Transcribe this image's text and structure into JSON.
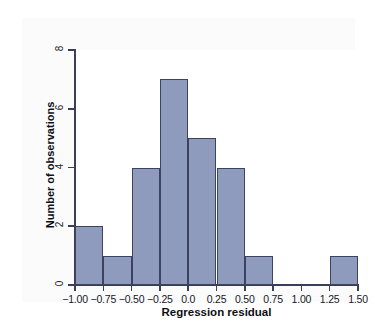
{
  "chart_data": {
    "type": "bar",
    "subtype": "histogram",
    "title": "",
    "xlabel": "Regression residual",
    "ylabel": "Number of observations",
    "xlim": [
      -1.0,
      1.5
    ],
    "ylim": [
      0,
      8
    ],
    "bin_width": 0.25,
    "grid": false,
    "legend": null,
    "x_tick_labels": [
      "−1.00",
      "−0.75",
      "−0.50",
      "−0.25",
      "0.0",
      "0.25",
      "0.50",
      "0.75",
      "1.00",
      "1.25",
      "1.50"
    ],
    "x_tick_values": [
      -1.0,
      -0.75,
      -0.5,
      -0.25,
      0.0,
      0.25,
      0.5,
      0.75,
      1.0,
      1.25,
      1.5
    ],
    "y_tick_labels": [
      "0",
      "2",
      "4",
      "6",
      "8"
    ],
    "y_tick_values": [
      0,
      2,
      4,
      6,
      8
    ],
    "bins": [
      {
        "left": -1.0,
        "right": -0.75,
        "count": 2
      },
      {
        "left": -0.75,
        "right": -0.5,
        "count": 1
      },
      {
        "left": -0.5,
        "right": -0.25,
        "count": 4
      },
      {
        "left": -0.25,
        "right": 0.0,
        "count": 7
      },
      {
        "left": 0.0,
        "right": 0.25,
        "count": 5
      },
      {
        "left": 0.25,
        "right": 0.5,
        "count": 4
      },
      {
        "left": 0.5,
        "right": 0.75,
        "count": 1
      },
      {
        "left": 0.75,
        "right": 1.0,
        "count": 0
      },
      {
        "left": 1.0,
        "right": 1.25,
        "count": 0
      },
      {
        "left": 1.25,
        "right": 1.5,
        "count": 1
      }
    ],
    "categories": [
      "-1.00 to -0.75",
      "-0.75 to -0.50",
      "-0.50 to -0.25",
      "-0.25 to 0.00",
      "0.00 to 0.25",
      "0.25 to 0.50",
      "0.50 to 0.75",
      "0.75 to 1.00",
      "1.00 to 1.25",
      "1.25 to 1.50"
    ],
    "values": [
      2,
      1,
      4,
      7,
      5,
      4,
      1,
      0,
      0,
      1
    ],
    "total_observations": 25,
    "colors": {
      "bar_fill": "#8f9bbd",
      "bar_edge": "#3c4260",
      "axis": "#3a3f55",
      "text": "#16181f",
      "panel_background": "#fbfbfc",
      "page_background": "#f2f3f5"
    }
  }
}
